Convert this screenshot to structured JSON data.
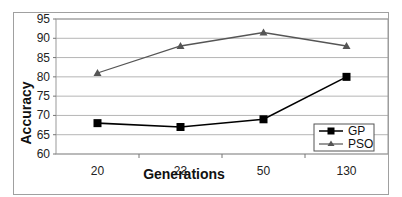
{
  "chart_data": {
    "type": "line",
    "title": "",
    "xlabel": "Generations",
    "ylabel": "Accuracy",
    "categories": [
      "20",
      "23",
      "50",
      "130"
    ],
    "series": [
      {
        "name": "GP",
        "values": [
          68,
          67,
          69,
          80
        ],
        "color": "#000000",
        "marker": "square"
      },
      {
        "name": "PSO",
        "values": [
          81,
          88,
          91.5,
          88
        ],
        "color": "#555555",
        "marker": "triangle"
      }
    ],
    "ylim": [
      60,
      95
    ],
    "yticks": [
      "95",
      "90",
      "85",
      "80",
      "75",
      "70",
      "65",
      "60"
    ],
    "grid": true,
    "legend_position": "lower right inside"
  }
}
